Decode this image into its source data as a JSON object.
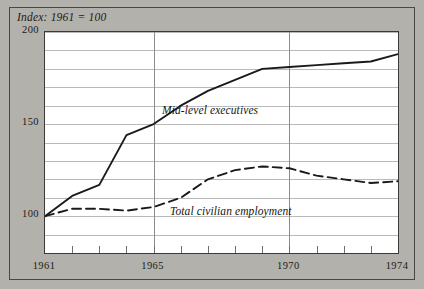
{
  "figure": {
    "background_color": "#b3b1ab",
    "plot_background_color": "#ffffff",
    "frame_color": "#3c3a37",
    "gridline_color": "#b9b9b9",
    "axis_marker_color": "#8c8c8c"
  },
  "chart_data": {
    "type": "line",
    "title": "Index: 1961 = 100",
    "xlabel": "",
    "ylabel": "",
    "xlim": [
      1961,
      1974
    ],
    "ylim": [
      80,
      200
    ],
    "grid": true,
    "grid_y_step": 10,
    "legend_position": "inline-labels",
    "y_ticks": [
      100,
      150,
      200
    ],
    "y_tick_labels": [
      "100",
      "150",
      "200"
    ],
    "y_gridlines": [
      80,
      90,
      100,
      110,
      120,
      130,
      140,
      150,
      160,
      170,
      180,
      190,
      200
    ],
    "x_ticks": [
      1961,
      1962,
      1963,
      1964,
      1965,
      1966,
      1967,
      1968,
      1969,
      1970,
      1971,
      1972,
      1973,
      1974
    ],
    "x_tick_labels": [
      "1961",
      "",
      "",
      "",
      "1965",
      "",
      "",
      "",
      "",
      "1970",
      "",
      "",
      "",
      "1974"
    ],
    "x_vertical_gridlines": [
      1965,
      1970
    ],
    "x": [
      1961,
      1962,
      1963,
      1964,
      1965,
      1966,
      1967,
      1968,
      1969,
      1970,
      1971,
      1972,
      1973,
      1974
    ],
    "series": [
      {
        "name": "Mid-level executives",
        "style": "solid",
        "color": "#1a1a1a",
        "label_text": "Mid-level executives",
        "values": [
          100,
          111,
          117,
          144,
          150,
          160,
          168,
          174,
          180,
          181,
          182,
          183,
          184,
          188
        ]
      },
      {
        "name": "Total civilian employment",
        "style": "dashed",
        "color": "#1a1a1a",
        "label_text": "Total civilian employment",
        "values": [
          100,
          104,
          104,
          103,
          105,
          110,
          120,
          125,
          127,
          126,
          122,
          120,
          118,
          119
        ]
      }
    ]
  }
}
